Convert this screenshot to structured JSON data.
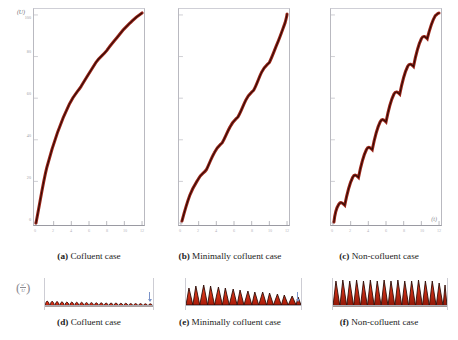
{
  "figure": {
    "axis": {
      "ylabel_top": "(U)",
      "xlabel_right": "(t)",
      "ratio_label_num": "u'",
      "ratio_label_den": "U",
      "ytick_labels": [
        "0",
        "20",
        "40",
        "60",
        "80",
        "100"
      ],
      "xtick_labels": [
        "0",
        "2",
        "4",
        "6",
        "8",
        "10",
        "12"
      ]
    },
    "panels": [
      {
        "tag": "(a)",
        "label": "Cofluent case",
        "name": "panel-a"
      },
      {
        "tag": "(b)",
        "label": "Minimally cofluent case",
        "name": "panel-b"
      },
      {
        "tag": "(c)",
        "label": "Non-cofluent case",
        "name": "panel-c"
      },
      {
        "tag": "(d)",
        "label": "Cofluent case",
        "name": "panel-d"
      },
      {
        "tag": "(e)",
        "label": "Minimally cofluent case",
        "name": "panel-e"
      },
      {
        "tag": "(f)",
        "label": "Non-cofluent case",
        "name": "panel-f"
      }
    ],
    "colors": {
      "curve_outer": "#9c2418",
      "curve_core": "#2a0a06",
      "fill_bright": "#e03418",
      "fill_dark": "#5c1008",
      "frame": "#b9b9c0",
      "tick_text": "#9c9ca4",
      "caption_text": "#1b1b1b",
      "arrow": "#7b93c8"
    }
  },
  "chart_data": [
    {
      "type": "line",
      "name": "panel-a",
      "title": "(a) Cofluent case",
      "xlabel": "t",
      "ylabel": "U",
      "xlim": [
        0,
        12
      ],
      "ylim": [
        0,
        105
      ],
      "grid": false,
      "legend": "none",
      "step_count": 11,
      "step_amplitude": 0.7,
      "x": [
        0.0,
        0.6,
        1.2,
        1.8,
        2.4,
        3.0,
        3.6,
        4.2,
        4.8,
        5.4,
        6.0,
        6.6,
        7.2,
        7.8,
        8.4,
        9.0,
        9.6,
        10.2,
        10.8,
        11.4,
        12.0
      ],
      "y": [
        0,
        6.5,
        13.0,
        19.2,
        25.3,
        31.2,
        37.0,
        42.6,
        48.0,
        53.3,
        58.4,
        63.4,
        68.2,
        72.8,
        77.2,
        81.4,
        85.4,
        89.2,
        92.8,
        96.2,
        99.4
      ]
    },
    {
      "type": "line",
      "name": "panel-b",
      "title": "(b) Minimally cofluent case",
      "xlabel": "t",
      "ylabel": "U",
      "xlim": [
        0,
        12
      ],
      "ylim": [
        0,
        105
      ],
      "grid": false,
      "legend": "none",
      "step_count": 10,
      "step_amplitude": 2.6,
      "x": [
        0.0,
        0.6,
        1.2,
        1.8,
        2.4,
        3.0,
        3.6,
        4.2,
        4.8,
        5.4,
        6.0,
        6.6,
        7.2,
        7.8,
        8.4,
        9.0,
        9.6,
        10.2,
        10.8,
        11.4,
        12.0
      ],
      "y": [
        0,
        5.0,
        11.5,
        17.0,
        23.5,
        29.0,
        35.5,
        41.0,
        47.5,
        53.0,
        59.5,
        65.0,
        71.0,
        76.5,
        82.0,
        86.5,
        90.5,
        93.5,
        96.0,
        98.0,
        99.6
      ]
    },
    {
      "type": "line",
      "name": "panel-c",
      "title": "(c) Non-cofluent case",
      "xlabel": "t",
      "ylabel": "U",
      "xlim": [
        0,
        12
      ],
      "ylim": [
        0,
        105
      ],
      "grid": false,
      "legend": "none",
      "step_count": 10,
      "step_amplitude": 5.5,
      "x": [
        0.0,
        0.6,
        1.2,
        1.8,
        2.4,
        3.0,
        3.6,
        4.2,
        4.8,
        5.4,
        6.0,
        6.6,
        7.2,
        7.8,
        8.4,
        9.0,
        9.6,
        10.2,
        10.8,
        11.4,
        12.0
      ],
      "y": [
        0,
        3.0,
        10.5,
        15.0,
        22.0,
        27.0,
        34.0,
        39.0,
        46.5,
        51.5,
        59.0,
        64.0,
        71.0,
        76.0,
        82.5,
        87.0,
        92.0,
        95.0,
        97.5,
        99.0,
        100.0
      ]
    },
    {
      "type": "area",
      "name": "panel-d",
      "title": "(d) Cofluent case",
      "xlabel": "t",
      "ylabel": "u'/U",
      "grid": false,
      "legend": "none",
      "peak_count": 11,
      "peak_height_rel": 0.45,
      "peak_shape": "rounded",
      "peak_amplitudes": [
        0.46,
        0.45,
        0.44,
        0.42,
        0.41,
        0.4,
        0.39,
        0.38,
        0.37,
        0.36,
        0.34
      ]
    },
    {
      "type": "area",
      "name": "panel-e",
      "title": "(e) Minimally cofluent case",
      "xlabel": "t",
      "ylabel": "u'/U",
      "grid": false,
      "legend": "none",
      "peak_count": 10,
      "peak_height_rel": 0.75,
      "peak_shape": "triangular",
      "peak_amplitudes": [
        0.78,
        0.8,
        0.82,
        0.79,
        0.76,
        0.73,
        0.7,
        0.67,
        0.63,
        0.58
      ]
    },
    {
      "type": "area",
      "name": "panel-f",
      "title": "(f) Non-cofluent case",
      "xlabel": "t",
      "ylabel": "u'/U",
      "grid": false,
      "legend": "none",
      "peak_count": 11,
      "peak_height_rel": 1.0,
      "peak_shape": "spiky",
      "peak_amplitudes": [
        0.95,
        1.0,
        0.98,
        1.0,
        0.97,
        0.99,
        0.96,
        0.98,
        0.95,
        0.97,
        0.9
      ]
    }
  ]
}
